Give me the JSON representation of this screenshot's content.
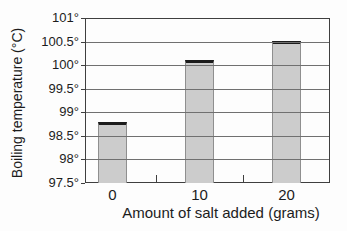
{
  "chart_data": {
    "type": "bar",
    "categories": [
      "0",
      "10",
      "20"
    ],
    "values": [
      98.8,
      100.1,
      100.52
    ],
    "title": "",
    "xlabel": "Amount of salt added (grams)",
    "ylabel": "Boiling temperature (°C)",
    "ylim": [
      97.5,
      101
    ],
    "ytick_step": 0.5,
    "yticks": [
      97.5,
      98,
      98.5,
      99,
      99.5,
      100,
      100.5,
      101
    ],
    "ytick_labels": [
      "97.5°",
      "98°",
      "98.5°",
      "99°",
      "99.5°",
      "100°",
      "100.5°",
      "101°"
    ],
    "grid": true,
    "legend": false,
    "colors": {
      "background": "#fdfdfd",
      "bar_fill": "#cccccc",
      "bar_side_edge": "#8f8f8f",
      "bar_top_edge": "#1c1c1c",
      "gridline": "#707070",
      "axis": "#3f3f3f",
      "text": "#1c1c1c"
    }
  }
}
